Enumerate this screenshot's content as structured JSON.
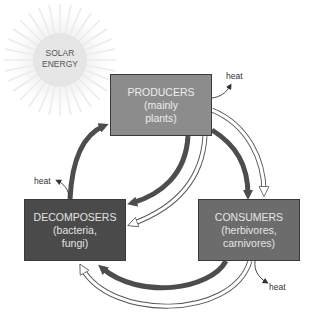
{
  "diagram": {
    "sun": {
      "label_line1": "SOLAR",
      "label_line2": "ENERGY"
    },
    "nodes": {
      "producers": {
        "title": "PRODUCERS",
        "sub1": "(mainly",
        "sub2": "plants)"
      },
      "consumers": {
        "title": "CONSUMERS",
        "sub1": "(herbivores,",
        "sub2": "carnivores)"
      },
      "decomposers": {
        "title": "DECOMPOSERS",
        "sub1": "(bacteria,",
        "sub2": "fungi)"
      }
    },
    "heat_labels": [
      "heat",
      "heat",
      "heat"
    ],
    "edges": [
      {
        "from": "producers",
        "to": "consumers",
        "kind": "solid"
      },
      {
        "from": "producers",
        "to": "consumers",
        "kind": "hollow"
      },
      {
        "from": "producers",
        "to": "decomposers",
        "kind": "solid"
      },
      {
        "from": "producers",
        "to": "decomposers",
        "kind": "hollow"
      },
      {
        "from": "consumers",
        "to": "decomposers",
        "kind": "solid"
      },
      {
        "from": "consumers",
        "to": "decomposers",
        "kind": "hollow"
      },
      {
        "from": "decomposers",
        "to": "producers",
        "kind": "solid"
      }
    ],
    "colors": {
      "producers": "#8c8c8c",
      "consumers": "#6c6c6c",
      "decomposers": "#4a4a4a",
      "solid_arrow": "#4d4d4d",
      "sun": "#e9e9e9"
    }
  }
}
